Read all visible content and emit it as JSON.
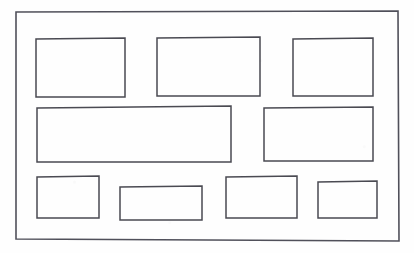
{
  "document": {
    "title": "Hand-drawn layout wireframe sketch",
    "medium": "pencil-on-paper",
    "canvas_width": 414,
    "canvas_height": 253,
    "background_color": "#fefefe",
    "stroke_color": "#4a4a52",
    "frame_stroke_color": "#50505a",
    "stroke_width": 1.5
  },
  "frame": {
    "name": "page-border",
    "points": "16,12 398,11 399,241 16,239"
  },
  "rows": [
    {
      "name": "row-top",
      "boxes": [
        {
          "id": "box-top-left",
          "points": "36,39 125,38 125,97 36,97",
          "x": 36,
          "y": 38,
          "width": 89,
          "height": 59
        },
        {
          "id": "box-top-center",
          "points": "157,38 260,37 260,96 157,96",
          "x": 157,
          "y": 37,
          "width": 103,
          "height": 59
        },
        {
          "id": "box-top-right",
          "points": "293,39 373,38 373,96 293,96",
          "x": 293,
          "y": 38,
          "width": 80,
          "height": 58
        }
      ]
    },
    {
      "name": "row-middle",
      "boxes": [
        {
          "id": "box-middle-wide",
          "points": "37,108 231,106 231,162 37,162",
          "x": 37,
          "y": 106,
          "width": 194,
          "height": 56
        },
        {
          "id": "box-middle-right",
          "points": "264,108 373,107 373,161 264,161",
          "x": 264,
          "y": 107,
          "width": 109,
          "height": 54
        }
      ]
    },
    {
      "name": "row-bottom",
      "boxes": [
        {
          "id": "box-bottom-1",
          "points": "37,177 99,176 99,218 37,218",
          "x": 37,
          "y": 176,
          "width": 62,
          "height": 42
        },
        {
          "id": "box-bottom-2",
          "points": "120,187 202,186 202,220 120,220",
          "x": 120,
          "y": 186,
          "width": 82,
          "height": 34
        },
        {
          "id": "box-bottom-3",
          "points": "226,177 297,176 297,218 226,218",
          "x": 226,
          "y": 176,
          "width": 71,
          "height": 42
        },
        {
          "id": "box-bottom-4",
          "points": "318,182 377,181 377,218 318,218",
          "x": 318,
          "y": 181,
          "width": 59,
          "height": 37
        }
      ]
    }
  ]
}
